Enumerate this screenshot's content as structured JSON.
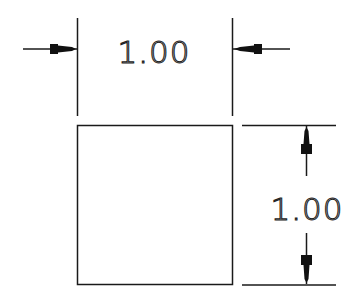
{
  "diagram": {
    "type": "dimensioned-square",
    "shape": {
      "name": "square",
      "width_label": "1.00",
      "height_label": "1.00"
    },
    "dimensions": {
      "horizontal": {
        "label": "1.00",
        "arrows": "outside-pointing-inward"
      },
      "vertical": {
        "label": "1.00",
        "arrows": "inside-pointing-outward"
      }
    },
    "colors": {
      "line": "#1a1a1a",
      "background": "#ffffff"
    }
  }
}
